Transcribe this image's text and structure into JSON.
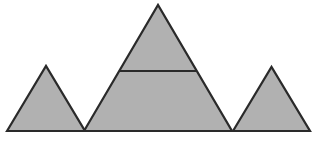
{
  "figure": {
    "canvas": {
      "width": 316,
      "height": 141,
      "background": "#ffffff"
    },
    "style": {
      "fill_color": "#b1b1b1",
      "stroke_color": "#2a2a2a",
      "stroke_width": 2.2
    },
    "shapes": [
      {
        "name": "left-triangle",
        "type": "polygon",
        "points": "7,131 46,66 85,131"
      },
      {
        "name": "middle-triangle",
        "type": "polygon",
        "points": "84,131 158,5 232,131"
      },
      {
        "name": "right-triangle",
        "type": "polygon",
        "points": "233,131 271.5,67 310,131"
      }
    ],
    "lines": [
      {
        "name": "middle-triangle-horizontal-line",
        "x1": 119,
        "y1": 71,
        "x2": 197,
        "y2": 71
      }
    ]
  }
}
